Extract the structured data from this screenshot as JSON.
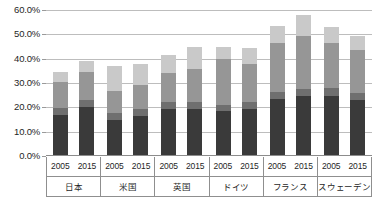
{
  "chart_data": {
    "type": "bar",
    "subtype": "stacked-column",
    "title": "",
    "subtitle": "",
    "xlabel": "",
    "ylabel": "",
    "ylim": [
      0,
      60
    ],
    "ytick_labels": [
      "0.0%",
      "10.0%",
      "20.0%",
      "30.0%",
      "40.0%",
      "50.0%",
      "60.0%"
    ],
    "ytick_values": [
      0,
      10,
      20,
      30,
      40,
      50,
      60
    ],
    "grid": true,
    "legend": "none",
    "groups": [
      "日本",
      "米国",
      "英国",
      "ドイツ",
      "フランス",
      "スウェーデン"
    ],
    "categories": [
      "日本 2005",
      "日本 2015",
      "米国 2005",
      "米国 2015",
      "英国 2005",
      "英国 2015",
      "ドイツ 2005",
      "ドイツ 2015",
      "フランス 2005",
      "フランス 2015",
      "スウェーデン 2005",
      "スウェーデン 2015"
    ],
    "years": [
      "2005",
      "2015"
    ],
    "series": [
      {
        "name": "segment-1",
        "color": "#3a3a3a",
        "values": [
          17.0,
          20.0,
          14.8,
          16.5,
          19.5,
          19.5,
          18.5,
          19.5,
          23.5,
          24.5,
          24.5,
          23.0
        ]
      },
      {
        "name": "segment-2",
        "color": "#6f6f6f",
        "values": [
          2.8,
          3.0,
          2.8,
          3.0,
          2.5,
          2.8,
          2.5,
          2.5,
          3.0,
          3.0,
          3.5,
          3.0
        ]
      },
      {
        "name": "segment-3",
        "color": "#969696",
        "values": [
          10.5,
          11.5,
          9.0,
          9.5,
          12.0,
          13.5,
          19.0,
          16.0,
          20.0,
          22.0,
          18.5,
          17.5
        ]
      },
      {
        "name": "segment-4",
        "color": "#c9c9c9",
        "values": [
          4.2,
          4.5,
          10.4,
          9.0,
          7.5,
          9.2,
          5.0,
          6.5,
          7.0,
          8.5,
          6.5,
          6.0
        ]
      }
    ],
    "totals": [
      34.5,
      39.0,
      37.0,
      38.0,
      41.5,
      45.0,
      45.0,
      44.5,
      53.5,
      58.0,
      53.0,
      49.5
    ],
    "bars": [
      {
        "group": "日本",
        "year": "2005",
        "values": [
          17.0,
          2.8,
          10.5,
          4.2
        ],
        "total": 34.5
      },
      {
        "group": "日本",
        "year": "2015",
        "values": [
          20.0,
          3.0,
          11.5,
          4.5
        ],
        "total": 39.0
      },
      {
        "group": "米国",
        "year": "2005",
        "values": [
          14.8,
          2.8,
          9.0,
          10.4
        ],
        "total": 37.0
      },
      {
        "group": "米国",
        "year": "2015",
        "values": [
          16.5,
          3.0,
          9.5,
          9.0
        ],
        "total": 38.0
      },
      {
        "group": "英国",
        "year": "2005",
        "values": [
          19.5,
          2.5,
          12.0,
          7.5
        ],
        "total": 41.5
      },
      {
        "group": "英国",
        "year": "2015",
        "values": [
          19.5,
          2.8,
          13.5,
          9.2
        ],
        "total": 45.0
      },
      {
        "group": "ドイツ",
        "year": "2005",
        "values": [
          18.5,
          2.5,
          19.0,
          5.0
        ],
        "total": 45.0
      },
      {
        "group": "ドイツ",
        "year": "2015",
        "values": [
          19.5,
          2.5,
          16.0,
          6.5
        ],
        "total": 44.5
      },
      {
        "group": "フランス",
        "year": "2005",
        "values": [
          23.5,
          3.0,
          20.0,
          7.0
        ],
        "total": 53.5
      },
      {
        "group": "フランス",
        "year": "2015",
        "values": [
          24.5,
          3.0,
          22.0,
          8.5
        ],
        "total": 58.0
      },
      {
        "group": "スウェーデン",
        "year": "2005",
        "values": [
          24.5,
          3.5,
          18.5,
          6.5
        ],
        "total": 53.0
      },
      {
        "group": "スウェーデン",
        "year": "2015",
        "values": [
          23.0,
          3.0,
          17.5,
          6.0
        ],
        "total": 49.5
      }
    ],
    "colors": {
      "segment_1": "#3a3a3a",
      "segment_2": "#6f6f6f",
      "segment_3": "#969696",
      "segment_4": "#c9c9c9",
      "gridline": "#bdbdbd",
      "axis_line": "#8f8f8f",
      "background": "#ffffff",
      "text": "#1f1f1f"
    }
  }
}
